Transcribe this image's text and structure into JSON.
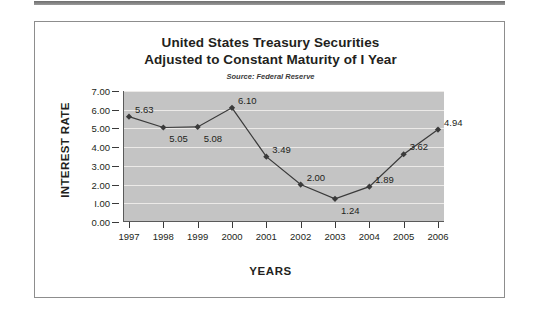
{
  "chart_data": {
    "type": "line",
    "title_line1": "United States Treasury Securities",
    "title_line2": "Adjusted to Constant Maturity of I Year",
    "subtitle": "Source:  Federal Reserve",
    "xlabel": "YEARS",
    "ylabel": "INTEREST RATE",
    "categories": [
      "1997",
      "1998",
      "1999",
      "2000",
      "2001",
      "2002",
      "2003",
      "2004",
      "2005",
      "2006"
    ],
    "values": [
      5.63,
      5.05,
      5.08,
      6.1,
      3.49,
      2.0,
      1.24,
      1.89,
      3.62,
      4.94
    ],
    "point_labels": [
      "5.63",
      "5.05",
      "5.08",
      "6.10",
      "3.49",
      "2.00",
      "1.24",
      "1.89",
      "3.62",
      "4.94"
    ],
    "ylim": [
      0.0,
      7.0
    ],
    "ytick_values": [
      7.0,
      6.0,
      5.0,
      4.0,
      3.0,
      2.0,
      1.0,
      0.0
    ],
    "ytick_labels": [
      "7.00",
      "6.00",
      "5.00",
      "4.00",
      "3.00",
      "2.00",
      "I.00",
      "0.00"
    ],
    "grid": true,
    "legend": "none",
    "marker": "diamond",
    "plot_background": "#c4c4c4",
    "gridline_color": "#eceae8",
    "series_color": "#3a3a3a",
    "axis_color": "#5a5a5a"
  }
}
